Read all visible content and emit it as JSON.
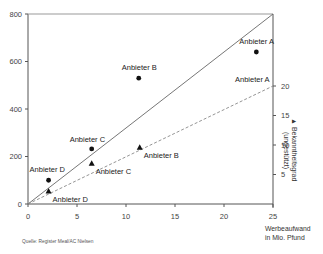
{
  "chart_data": {
    "type": "scatter",
    "title": "",
    "source": "Quelle: Register Meal/AC Nielsen",
    "xlabel": "Werbeaufwand in Mio. Pfund",
    "xlabel_lines": [
      "Werbeaufwand",
      "in Mio. Pfund"
    ],
    "ylabel_left": "",
    "ylabel_right": "Bekanntheitsgrad (ungestützt)",
    "ylabel_right_lines": [
      "Bekanntheitsgrad",
      "(ungestützt)"
    ],
    "xlim": [
      0,
      25
    ],
    "ylim_left": [
      0,
      800
    ],
    "ylim_right": [
      0,
      27
    ],
    "x_ticks": [
      0,
      5,
      10,
      15,
      20,
      25
    ],
    "y_ticks_left": [
      0,
      200,
      400,
      600,
      800
    ],
    "y_ticks_right": [
      5,
      10,
      15,
      20
    ],
    "grid": false,
    "series": [
      {
        "name": "Left axis (circles)",
        "marker": "circle",
        "axis": "left",
        "points": [
          {
            "label": "Anbieter A",
            "x": 23.3,
            "y": 640
          },
          {
            "label": "Anbieter B",
            "x": 11.3,
            "y": 530
          },
          {
            "label": "Anbieter C",
            "x": 6.5,
            "y": 232
          },
          {
            "label": "Anbieter D",
            "x": 2.1,
            "y": 100
          }
        ]
      },
      {
        "name": "Bekanntheitsgrad (ungestützt)",
        "marker": "triangle",
        "axis": "right",
        "points": [
          {
            "label": "Anbieter A",
            "x": 25,
            "y": 20
          },
          {
            "label": "Anbieter B",
            "x": 11.4,
            "y": 9.6
          },
          {
            "label": "Anbieter C",
            "x": 6.5,
            "y": 6.9
          },
          {
            "label": "Anbieter D",
            "x": 2.1,
            "y": 2.2
          }
        ]
      }
    ],
    "reference_lines": [
      {
        "style": "solid",
        "from": [
          0,
          0
        ],
        "to": [
          25,
          800
        ],
        "axis": "left"
      },
      {
        "style": "dashed",
        "from": [
          0,
          0
        ],
        "to": [
          25,
          20
        ],
        "axis": "right"
      }
    ],
    "colors": {
      "axis": "#555555",
      "marker": "#111111",
      "line": "#666666",
      "dashed": "#888888"
    }
  }
}
